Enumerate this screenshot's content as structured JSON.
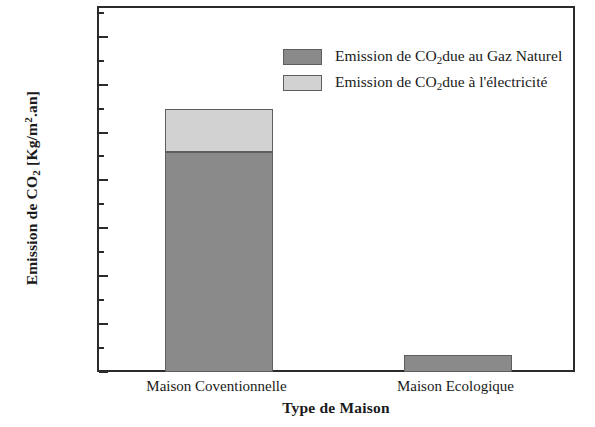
{
  "chart_data": {
    "type": "bar",
    "subtype": "stacked",
    "title": "",
    "xlabel": "Type de Maison",
    "ylabel_parts": {
      "prefix": "Emission de CO",
      "sub": "2",
      "units_open": " [Kg/m",
      "units_sup": "2",
      "units_close": ".an]"
    },
    "ylabel_plain": "Emission de CO2 [Kg/m2.an]",
    "categories": [
      "Maison Coventionnelle",
      "Maison Ecologique"
    ],
    "series": [
      {
        "name": "Emission de CO2 due au Gaz Naturel",
        "name_parts": {
          "prefix": "Emission de CO",
          "sub": "2",
          "suffix": "due au Gaz Naturel"
        },
        "color": "#8a8a8a",
        "values": [
          92,
          7
        ]
      },
      {
        "name": "Emission de CO2 due à l'électricité",
        "name_parts": {
          "prefix": "Emission de CO",
          "sub": "2",
          "suffix": "due à l'électricité"
        },
        "color": "#d2d2d2",
        "values": [
          18,
          0
        ]
      }
    ],
    "totals": [
      110,
      7
    ],
    "ylim": [
      0,
      152
    ],
    "ytick_major": [
      0,
      20,
      40,
      60,
      80,
      100,
      120,
      140
    ],
    "ytick_minor": [
      10,
      30,
      50,
      70,
      90,
      110,
      130,
      150
    ],
    "ytick_labels": [
      "0",
      "20",
      "40",
      "60",
      "80",
      "100",
      "120",
      "140"
    ],
    "grid": false,
    "legend_position": "top-center",
    "frame": "box",
    "axis_color": "#2b2b2b"
  },
  "legend": {
    "items": [
      {
        "label_prefix": "Emission de CO",
        "label_sub": "2",
        "label_suffix": "due au Gaz Naturel",
        "color": "#8a8a8a"
      },
      {
        "label_prefix": "Emission de CO",
        "label_sub": "2",
        "label_suffix": "due à l'électricité",
        "color": "#d2d2d2"
      }
    ]
  },
  "axes": {
    "x_title": "Type de Maison",
    "y_title_prefix": "Emission de CO",
    "y_title_sub": "2",
    "y_title_units_open": " [Kg/m",
    "y_title_units_sup": "2",
    "y_title_units_close": ".an]",
    "x_categories": [
      "Maison Coventionnelle",
      "Maison Ecologique"
    ],
    "y_labels": [
      "140",
      "120",
      "100",
      "80",
      "60",
      "40",
      "20",
      "0"
    ]
  }
}
